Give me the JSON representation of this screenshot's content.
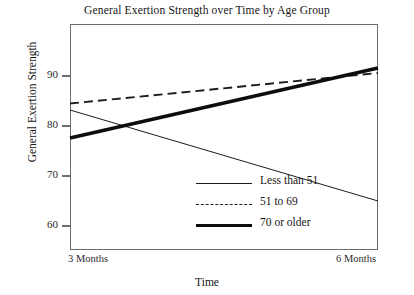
{
  "chart_data": {
    "type": "line",
    "title": "General Exertion Strength over Time by Age Group",
    "xlabel": "Time",
    "ylabel": "General Exertion Strength",
    "categories": [
      "3 Months",
      "6 Months"
    ],
    "x_tick_labels": [
      "3 Months",
      "6 Months"
    ],
    "y_tick_labels": [
      "60",
      "70",
      "80",
      "90"
    ],
    "y_ticks": [
      60,
      70,
      80,
      90
    ],
    "ylim": [
      55.2,
      100.4
    ],
    "xlim": [
      0,
      1
    ],
    "grid": false,
    "legend_position": "inside lower-right",
    "series": [
      {
        "name": "Less than 51",
        "values": [
          83.2,
          65.0
        ],
        "style": "thin-solid",
        "color": "#1d1d1d"
      },
      {
        "name": "51 to 69",
        "values": [
          84.5,
          90.6
        ],
        "style": "dashed",
        "color": "#1d1d1d"
      },
      {
        "name": "70 or older",
        "values": [
          77.6,
          91.6
        ],
        "style": "thick-solid",
        "color": "#0d0d0d"
      }
    ]
  },
  "legend": {
    "items": [
      {
        "label": "Less than 51"
      },
      {
        "label": "51 to 69"
      },
      {
        "label": "70 or older"
      }
    ]
  },
  "axes": {
    "frame_color": "#6e6e72",
    "tick_color": "#6e6e72"
  }
}
